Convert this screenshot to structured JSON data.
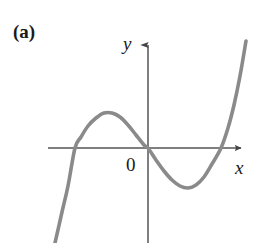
{
  "figure": {
    "panel_label": "(a)",
    "background_color": "#ffffff"
  },
  "labels": {
    "y_axis": "y",
    "x_axis": "x",
    "origin": "0"
  },
  "style": {
    "curve_color": "#8a8a8a",
    "axis_color": "#555555",
    "text_color": "#1a1a1a",
    "curve_width": 3.6,
    "axis_width": 1.5
  },
  "chart_data": {
    "type": "line",
    "title": "(a)",
    "xlabel": "x",
    "ylabel": "y",
    "grid": false,
    "legend": null,
    "annotations": [
      "(a)",
      "0"
    ],
    "axes_pixels": {
      "origin": [
        148,
        148
      ],
      "x_axis_y": 148,
      "y_axis_x": 148,
      "x_axis_start": 48,
      "x_axis_arrow_tip": 248,
      "y_axis_arrow_tip": 36,
      "y_axis_end": 243
    },
    "features": {
      "x_intercepts": [
        75,
        148,
        221
      ],
      "local_maximum": [
        110,
        113
      ],
      "local_minimum": [
        187,
        187
      ],
      "inflection": [
        148,
        148
      ]
    },
    "points": [
      [
        55,
        243
      ],
      [
        62,
        212
      ],
      [
        68,
        186
      ],
      [
        75,
        148
      ],
      [
        81,
        137
      ],
      [
        88,
        126
      ],
      [
        96,
        118
      ],
      [
        104,
        113
      ],
      [
        112,
        113
      ],
      [
        120,
        117
      ],
      [
        128,
        125
      ],
      [
        136,
        135
      ],
      [
        144,
        145
      ],
      [
        148,
        148
      ],
      [
        156,
        160
      ],
      [
        164,
        171
      ],
      [
        172,
        180
      ],
      [
        180,
        186
      ],
      [
        188,
        188
      ],
      [
        196,
        185
      ],
      [
        204,
        177
      ],
      [
        212,
        164
      ],
      [
        221,
        148
      ],
      [
        228,
        128
      ],
      [
        234,
        105
      ],
      [
        240,
        76
      ],
      [
        246,
        41
      ]
    ],
    "xlim": [
      48,
      248
    ],
    "ylim": [
      243,
      36
    ]
  }
}
